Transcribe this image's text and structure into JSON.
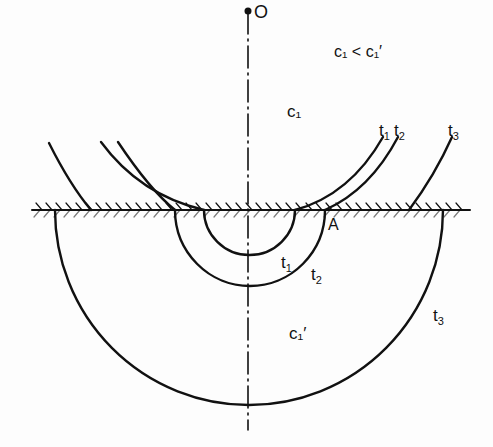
{
  "diagram": {
    "type": "wavefront-propagation-across-interface",
    "origin_label": "O",
    "relation_label": "c₁ < c₁′",
    "upper_medium_label": "c₁",
    "lower_medium_label": "c₁′",
    "point_label": "A",
    "wavefronts": [
      {
        "name": "t1",
        "label": "t",
        "sub": "1"
      },
      {
        "name": "t2",
        "label": "t",
        "sub": "2"
      },
      {
        "name": "t3",
        "label": "t",
        "sub": "3"
      }
    ],
    "colors": {
      "ink": "#111111",
      "background": "#fdfdfd"
    }
  }
}
